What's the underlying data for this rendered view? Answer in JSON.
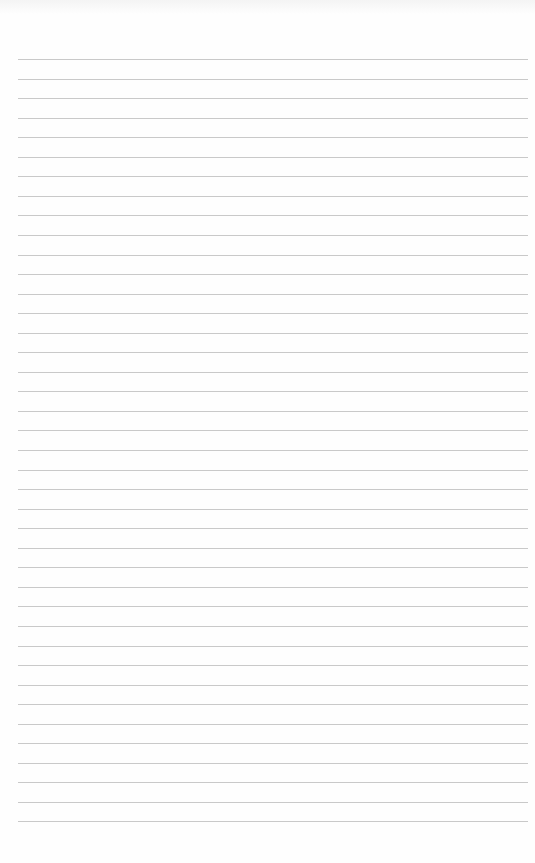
{
  "document": {
    "type": "lined-paper",
    "line_count": 40,
    "first_line_y": 59,
    "line_spacing": 19.55,
    "line_left": 18,
    "line_width": 510,
    "line_color": "#c9c9c9",
    "background_color": "#fefefe",
    "text": []
  }
}
